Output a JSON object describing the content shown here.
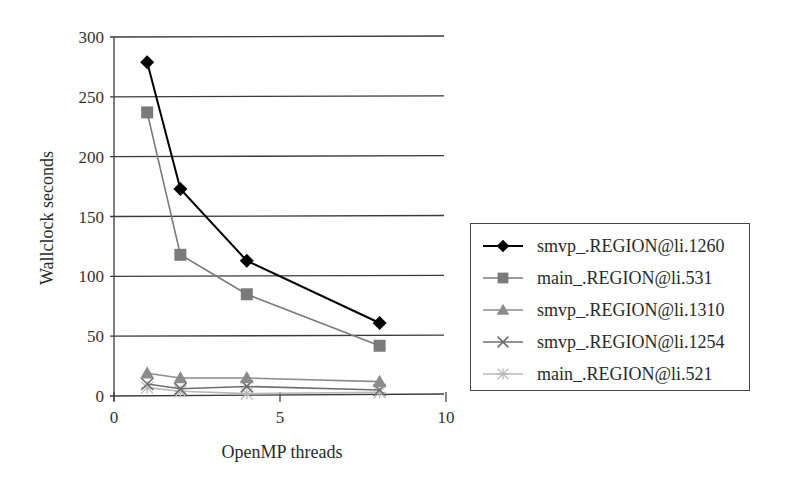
{
  "chart_data": {
    "type": "line",
    "title": "",
    "xlabel": "OpenMP threads",
    "ylabel": "Wallclock seconds",
    "xlim": [
      0,
      10
    ],
    "ylim": [
      0,
      300
    ],
    "x_ticks": [
      "0",
      "5",
      "10"
    ],
    "y_ticks": [
      "0",
      "50",
      "100",
      "150",
      "200",
      "250",
      "300"
    ],
    "grid": "horizontal",
    "legend_position": "right",
    "x": [
      1,
      2,
      4,
      8
    ],
    "series": [
      {
        "name": "smvp_.REGION@li.1260",
        "marker": "diamond",
        "color": "#000000",
        "values": [
          279,
          173,
          113,
          61
        ]
      },
      {
        "name": "main_.REGION@li.531",
        "marker": "square",
        "color": "#7a7a7a",
        "values": [
          237,
          118,
          85,
          42
        ]
      },
      {
        "name": "smvp_.REGION@li.1310",
        "marker": "triangle",
        "color": "#8c8c8c",
        "values": [
          19,
          15,
          15,
          12
        ]
      },
      {
        "name": "smvp_.REGION@li.1254",
        "marker": "x",
        "color": "#6e6e6e",
        "values": [
          10,
          6,
          8,
          5
        ]
      },
      {
        "name": "main_.REGION@li.521",
        "marker": "asterisk",
        "color": "#b8b8b8",
        "values": [
          7,
          4,
          2,
          3
        ]
      }
    ]
  },
  "axes": {
    "xlabel": "OpenMP threads",
    "ylabel": "Wallclock seconds"
  },
  "legend": {
    "items": [
      {
        "label": "smvp_.REGION@li.1260"
      },
      {
        "label": "main_.REGION@li.531"
      },
      {
        "label": "smvp_.REGION@li.1310"
      },
      {
        "label": "smvp_.REGION@li.1254"
      },
      {
        "label": "main_.REGION@li.521"
      }
    ]
  }
}
